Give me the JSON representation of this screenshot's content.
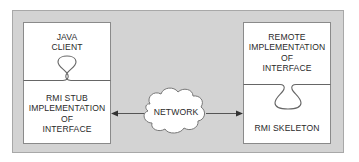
{
  "diagram": {
    "colors": {
      "background": "#ffffff",
      "container_fill": "#d3d3d3",
      "container_border": "#a8a8a8",
      "box_fill": "#ffffff",
      "box_border": "#8a8a8a",
      "line": "#555555",
      "text": "#2a2a2a"
    },
    "client_side": {
      "top_label": [
        "JAVA",
        "CLIENT"
      ],
      "bottom_label": [
        "RMI STUB",
        "IMPLEMENTATION",
        "OF",
        "INTERFACE"
      ]
    },
    "server_side": {
      "top_label": [
        "REMOTE",
        "IMPLEMENTATION",
        "OF",
        "INTERFACE"
      ],
      "bottom_label": [
        "RMI SKELETON"
      ]
    },
    "network": {
      "label": "NETWORK",
      "icon": "cloud-icon"
    },
    "connections": [
      {
        "from": "network",
        "to": "rmi-stub",
        "arrow": "arrow-left-icon"
      },
      {
        "from": "network",
        "to": "rmi-skeleton",
        "arrow": "arrow-right-icon"
      }
    ]
  }
}
